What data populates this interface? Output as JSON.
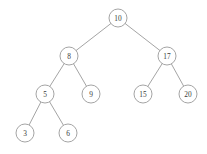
{
  "figure": {
    "caption": "",
    "background_color": "#ffffff",
    "stroke_color": "#9a9a9a",
    "text_color": "#3b3b3b",
    "node_radius": 9
  },
  "chart_data": {
    "type": "diagram",
    "diagram_type": "binary-search-tree",
    "xlabel": "",
    "ylabel": "",
    "grid": false,
    "legend": null,
    "node_radius": 9,
    "nodes": [
      {
        "id": "n10",
        "label": "10",
        "x": 118,
        "y": 18,
        "level": 0
      },
      {
        "id": "n8",
        "label": "8",
        "x": 69,
        "y": 56,
        "level": 1
      },
      {
        "id": "n17",
        "label": "17",
        "x": 167,
        "y": 56,
        "level": 1
      },
      {
        "id": "n5",
        "label": "5",
        "x": 45,
        "y": 94,
        "level": 2
      },
      {
        "id": "n9",
        "label": "9",
        "x": 91,
        "y": 94,
        "level": 2
      },
      {
        "id": "n15",
        "label": "15",
        "x": 143,
        "y": 94,
        "level": 2
      },
      {
        "id": "n20",
        "label": "20",
        "x": 188,
        "y": 94,
        "level": 2
      },
      {
        "id": "n3",
        "label": "3",
        "x": 25,
        "y": 133,
        "level": 3
      },
      {
        "id": "n6",
        "label": "6",
        "x": 68,
        "y": 133,
        "level": 3
      }
    ],
    "edges": [
      {
        "from": "n10",
        "to": "n8",
        "side": "left"
      },
      {
        "from": "n10",
        "to": "n17",
        "side": "right"
      },
      {
        "from": "n8",
        "to": "n5",
        "side": "left"
      },
      {
        "from": "n8",
        "to": "n9",
        "side": "right"
      },
      {
        "from": "n17",
        "to": "n15",
        "side": "left"
      },
      {
        "from": "n17",
        "to": "n20",
        "side": "right"
      },
      {
        "from": "n5",
        "to": "n3",
        "side": "left"
      },
      {
        "from": "n5",
        "to": "n6",
        "side": "right"
      }
    ],
    "values": [
      10,
      8,
      17,
      5,
      9,
      15,
      20,
      3,
      6
    ],
    "inorder": [
      3,
      5,
      6,
      8,
      9,
      10,
      15,
      17,
      20
    ],
    "root": "10"
  }
}
